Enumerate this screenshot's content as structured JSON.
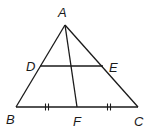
{
  "diagram": {
    "type": "geometry-triangle",
    "points": {
      "A": {
        "label": "A",
        "x": 65,
        "y": 25
      },
      "B": {
        "label": "B",
        "x": 16,
        "y": 107
      },
      "C": {
        "label": "C",
        "x": 138,
        "y": 107
      },
      "D": {
        "label": "D",
        "x": 40,
        "y": 66
      },
      "E": {
        "label": "E",
        "x": 103,
        "y": 66
      },
      "F": {
        "label": "F",
        "x": 77,
        "y": 107
      }
    },
    "segments": [
      "AB",
      "AC",
      "BC",
      "DE",
      "AF"
    ],
    "congruence_marks": [
      {
        "segment": "BF",
        "marks": 2
      },
      {
        "segment": "FC",
        "marks": 2
      }
    ]
  }
}
